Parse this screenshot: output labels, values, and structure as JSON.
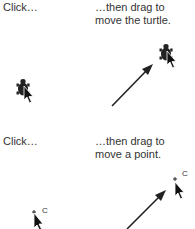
{
  "panels": [
    {
      "id": "turtle",
      "left_caption": "Click…",
      "right_caption_line1": "…then drag to",
      "right_caption_line2": "move the turtle.",
      "icons": [
        "turtle-icon",
        "cursor-arrow-icon",
        "drag-arrow-icon"
      ]
    },
    {
      "id": "point",
      "left_caption": "Click…",
      "right_caption_line1": "…then drag to",
      "right_caption_line2": "move a point.",
      "point_label": "C",
      "icons": [
        "point-icon",
        "cursor-arrow-icon",
        "drag-arrow-icon"
      ]
    }
  ],
  "colors": {
    "ink": "#222222",
    "text": "#333333",
    "background": "#ffffff"
  }
}
